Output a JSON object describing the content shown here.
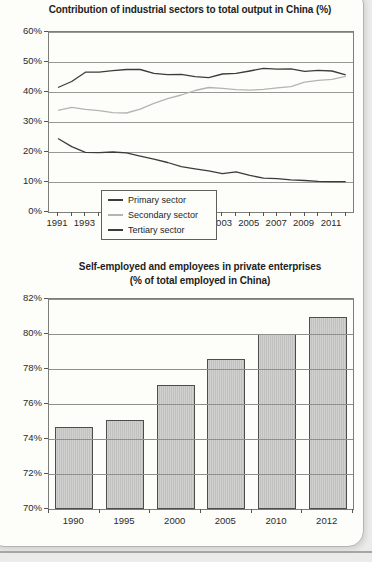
{
  "page": {
    "background_color": "#ebebe9",
    "card_color": "#fdfdfa",
    "card_border_color": "#b3b3b0"
  },
  "colors": {
    "dark_line": "#3c3c3c",
    "light_line": "#b4b4b4",
    "grid_line": "#989895",
    "bar_fill": "#c9c9c7",
    "bar_border": "#4d4d4a"
  },
  "chart_data": [
    {
      "type": "line",
      "title": "Contribution of industrial sectors to total output in China (%)",
      "x": [
        1991,
        1992,
        1993,
        1994,
        1995,
        1996,
        1997,
        1998,
        1999,
        2000,
        2001,
        2002,
        2003,
        2004,
        2005,
        2006,
        2007,
        2008,
        2009,
        2010,
        2011,
        2012
      ],
      "x_tick_labels": [
        "1991",
        "1993",
        "1995",
        "1997",
        "1999",
        "2001",
        "2003",
        "2005",
        "2007",
        "2009",
        "2011"
      ],
      "y_tick_labels": [
        "60%",
        "50%",
        "40%",
        "30%",
        "20%",
        "10%",
        "0%"
      ],
      "ylim": [
        0,
        60
      ],
      "grid": true,
      "legend_position": "inside lower-left",
      "series": [
        {
          "name": "Primary sector",
          "color": "#3c3c3c",
          "values": [
            24.5,
            21.8,
            19.9,
            19.8,
            20.0,
            19.7,
            18.6,
            17.6,
            16.5,
            15.1,
            14.4,
            13.7,
            12.8,
            13.4,
            12.2,
            11.3,
            11.1,
            10.7,
            10.5,
            10.2,
            10.1,
            10.1
          ]
        },
        {
          "name": "Secondary sector",
          "color": "#b4b4b4",
          "values": [
            33.9,
            34.9,
            34.2,
            33.8,
            33.1,
            33.0,
            34.3,
            36.2,
            37.8,
            39.0,
            40.5,
            41.5,
            41.2,
            40.8,
            40.6,
            40.9,
            41.4,
            41.8,
            43.3,
            43.9,
            44.2,
            45.2
          ]
        },
        {
          "name": "Tertiary sector",
          "color": "#3c3c3c",
          "values": [
            41.5,
            43.5,
            46.6,
            46.6,
            47.1,
            47.5,
            47.5,
            46.2,
            45.8,
            45.9,
            45.1,
            44.8,
            46.0,
            46.2,
            47.0,
            47.9,
            47.6,
            47.7,
            46.9,
            47.2,
            47.0,
            45.7
          ]
        }
      ]
    },
    {
      "type": "bar",
      "title": "Self-employed and employees in private enterprises",
      "subtitle": "(% of total employed in China)",
      "categories": [
        "1990",
        "1995",
        "2000",
        "2005",
        "2010",
        "2012"
      ],
      "values": [
        74.7,
        75.1,
        77.1,
        78.6,
        80.0,
        81.0
      ],
      "y_tick_labels": [
        "82%",
        "80%",
        "78%",
        "76%",
        "74%",
        "72%",
        "70%"
      ],
      "ylim": [
        70,
        82
      ],
      "grid": true,
      "grid_over_bars": true
    }
  ]
}
